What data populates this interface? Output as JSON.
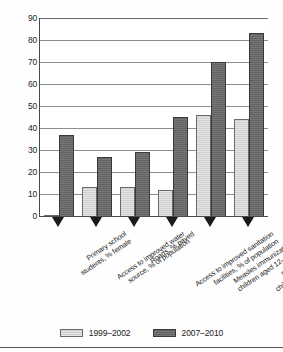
{
  "chart_data": {
    "type": "bar",
    "title": "",
    "subtitle": "",
    "xlabel": "",
    "ylabel": "",
    "ylim": [
      0,
      90
    ],
    "ytick_step": 10,
    "yticks": [
      "90",
      "80",
      "70",
      "60",
      "50",
      "40",
      "30",
      "20",
      "10",
      "0"
    ],
    "grid": true,
    "legend_position": "bottom",
    "categories": [
      "Primary school students, % female",
      "Access to improved water source, % of population",
      "Roads, % paved",
      "Access to improved sanitation facilities, % of population",
      "Measles immunization, % of children aged 12–23 months",
      "DPT immunization, % of children aged 12–23 months"
    ],
    "category_lines": [
      [
        "Primary school",
        "students, % female"
      ],
      [
        "Access to improved water",
        "source, % of population"
      ],
      [
        "Roads, % paved"
      ],
      [
        "Access to improved sanitation",
        "facilities, % of population"
      ],
      [
        "Measles immunization, % of",
        "children aged 12–23 months"
      ],
      [
        "DPT immunization, % of",
        "children aged 12–23 months"
      ]
    ],
    "series": [
      {
        "name": "1999–2002",
        "color": "#cfcfcf",
        "values": [
          0.5,
          13,
          13,
          12,
          46,
          44
        ]
      },
      {
        "name": "2007–2010",
        "color": "#636363",
        "values": [
          37,
          27,
          29,
          45,
          70,
          83
        ]
      }
    ]
  },
  "axis": {
    "y_max_label": "90",
    "y_min_label": "0"
  },
  "legend": {
    "items": [
      {
        "label": "1999–2002",
        "swatch": "light"
      },
      {
        "label": "2007–2010",
        "swatch": "dark"
      }
    ]
  }
}
